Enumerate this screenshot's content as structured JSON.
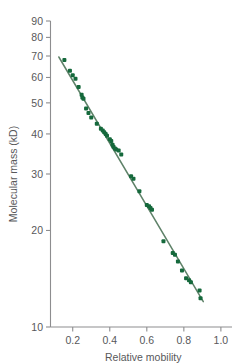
{
  "chart_data": {
    "type": "scatter",
    "title": "",
    "xlabel": "Relative mobility",
    "ylabel": "Molecular mass (kD)",
    "xlim": [
      0.08,
      1.06
    ],
    "ylim": [
      10,
      90
    ],
    "yscale": "log",
    "xscale": "linear",
    "grid": false,
    "legend": null,
    "xticks": [
      "0.2",
      "0.4",
      "0.6",
      "0.8",
      "1.0"
    ],
    "xtick_values": [
      0.2,
      0.4,
      0.6,
      0.8,
      1.0
    ],
    "yticks": [
      "10",
      "20",
      "30",
      "40",
      "50",
      "60",
      "70",
      "80",
      "90"
    ],
    "ytick_values": [
      10,
      20,
      30,
      40,
      50,
      60,
      70,
      80,
      90
    ],
    "marker_color": "#15693c",
    "line_color": "#5f8269",
    "axis_color": "#8d8d8f",
    "text_color": "#58585a",
    "marker_shape": "square",
    "series": [
      {
        "name": "protein standards",
        "points": [
          [
            0.155,
            68.0
          ],
          [
            0.185,
            63.0
          ],
          [
            0.2,
            61.0
          ],
          [
            0.215,
            59.5
          ],
          [
            0.232,
            56.0
          ],
          [
            0.248,
            53.0
          ],
          [
            0.252,
            52.0
          ],
          [
            0.258,
            51.5
          ],
          [
            0.272,
            48.0
          ],
          [
            0.285,
            46.5
          ],
          [
            0.3,
            45.0
          ],
          [
            0.33,
            43.0
          ],
          [
            0.352,
            41.5
          ],
          [
            0.362,
            41.0
          ],
          [
            0.37,
            40.5
          ],
          [
            0.378,
            40.0
          ],
          [
            0.385,
            39.5
          ],
          [
            0.4,
            38.5
          ],
          [
            0.408,
            38.0
          ],
          [
            0.415,
            37.0
          ],
          [
            0.42,
            36.5
          ],
          [
            0.428,
            36.0
          ],
          [
            0.435,
            35.8
          ],
          [
            0.448,
            35.5
          ],
          [
            0.462,
            34.5
          ],
          [
            0.515,
            29.5
          ],
          [
            0.528,
            29.0
          ],
          [
            0.56,
            26.5
          ],
          [
            0.6,
            24.0
          ],
          [
            0.612,
            23.8
          ],
          [
            0.62,
            23.5
          ],
          [
            0.628,
            23.2
          ],
          [
            0.69,
            18.5
          ],
          [
            0.74,
            17.0
          ],
          [
            0.752,
            16.8
          ],
          [
            0.768,
            16.0
          ],
          [
            0.79,
            15.0
          ],
          [
            0.812,
            14.2
          ],
          [
            0.828,
            14.0
          ],
          [
            0.838,
            13.8
          ],
          [
            0.885,
            13.0
          ],
          [
            0.89,
            12.3
          ]
        ]
      }
    ],
    "fit_line": {
      "name": "regression line",
      "x_start": 0.125,
      "y_start": 69.5,
      "x_end": 0.905,
      "y_end": 12.0
    }
  }
}
